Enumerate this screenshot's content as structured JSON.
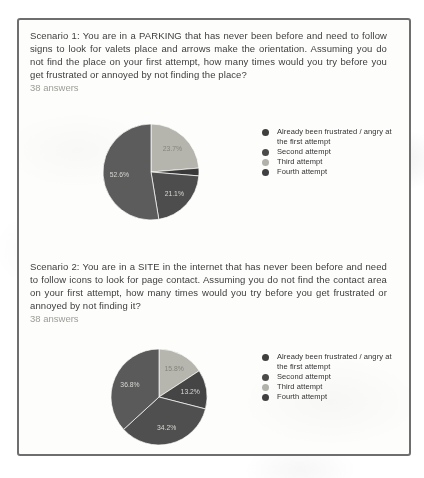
{
  "card": {
    "border_color": "#6e6e6e",
    "background": "#fdfdfc"
  },
  "sections": [
    {
      "question": "Scenario 1: You are in a PARKING that has never been before and need to follow signs to look for valets place and arrows make the orientation. Assuming you do not find the place on your first attempt, how many times would you try before you get frustrated or annoyed by not finding the place?",
      "answers_label": "38 answers"
    },
    {
      "question": "Scenario 2: You are in a SITE in the internet that has never been before and need to follow icons to look for page contact. Assuming you do not find the contact area on your first attempt, how many times would you try before you get frustrated or annoyed by not finding it?",
      "answers_label": "38 answers"
    }
  ],
  "legend": {
    "items": [
      {
        "label": "Already been frustrated / angry at the first attempt",
        "color": "#3f3f3f"
      },
      {
        "label": "Second attempt",
        "color": "#4a4a4a"
      },
      {
        "label": "Third attempt",
        "color": "#b2b2ab"
      },
      {
        "label": "Fourth attempt",
        "color": "#404040"
      }
    ]
  },
  "chart_data": [
    {
      "type": "pie",
      "title": "Scenario 1",
      "subtitle": "38 answers",
      "legend_position": "right",
      "categories": [
        "Already been frustrated / angry at the first attempt",
        "Second attempt",
        "Third attempt",
        "Fourth attempt"
      ],
      "values": [
        52.6,
        21.1,
        23.7,
        2.6
      ],
      "value_unit": "%",
      "slices_clockwise_from_top": [
        {
          "category": "Third attempt",
          "value_pct": 23.7,
          "label": "23.7%",
          "color": "#b5b5ae",
          "label_color": "#84847d"
        },
        {
          "category": "Fourth attempt",
          "value_pct": 2.6,
          "label": "",
          "color": "#393939",
          "label_color": "#d8d8d2"
        },
        {
          "category": "Second attempt",
          "value_pct": 21.1,
          "label": "21.1%",
          "color": "#4d4d4d",
          "label_color": "#d8d8d2"
        },
        {
          "category": "Already been frustrated / angry at the first attempt",
          "value_pct": 52.6,
          "label": "52.6%",
          "color": "#5c5c5c",
          "label_color": "#d8d8d2"
        }
      ]
    },
    {
      "type": "pie",
      "title": "Scenario 2",
      "subtitle": "38 answers",
      "legend_position": "right",
      "categories": [
        "Already been frustrated / angry at the first attempt",
        "Second attempt",
        "Third attempt",
        "Fourth attempt"
      ],
      "values": [
        36.8,
        34.2,
        15.8,
        13.2
      ],
      "value_unit": "%",
      "slices_clockwise_from_top": [
        {
          "category": "Third attempt",
          "value_pct": 15.8,
          "label": "15.8%",
          "color": "#b6b6af",
          "label_color": "#84847d"
        },
        {
          "category": "Fourth attempt",
          "value_pct": 13.2,
          "label": "13.2%",
          "color": "#454545",
          "label_color": "#d8d8d2"
        },
        {
          "category": "Second attempt",
          "value_pct": 34.2,
          "label": "34.2%",
          "color": "#4f4f4f",
          "label_color": "#d8d8d2"
        },
        {
          "category": "Already been frustrated / angry at the first attempt",
          "value_pct": 36.8,
          "label": "36.8%",
          "color": "#5a5a5a",
          "label_color": "#d8d8d2"
        }
      ]
    }
  ]
}
